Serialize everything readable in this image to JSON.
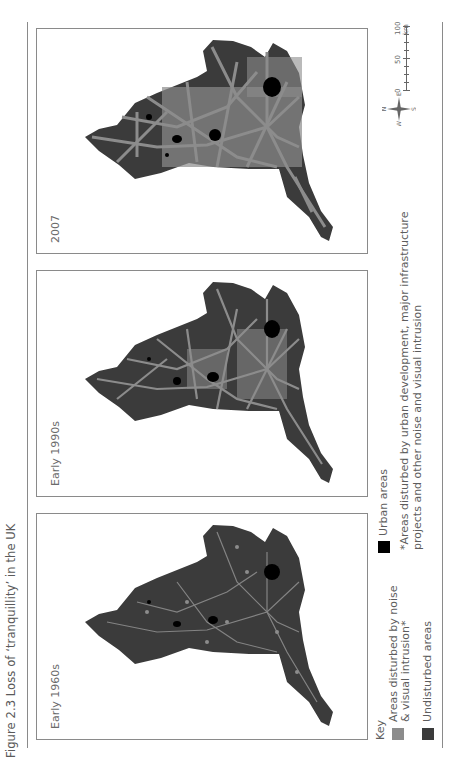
{
  "figure": {
    "title": "Figure 2.3  Loss of ‘tranquillity’ in the UK"
  },
  "panels": [
    {
      "label": "Early 1960s",
      "disturbed_level": "low"
    },
    {
      "label": "Early 1990s",
      "disturbed_level": "medium"
    },
    {
      "label": "2007",
      "disturbed_level": "high"
    }
  ],
  "legend": {
    "title": "Key",
    "items": [
      {
        "label_line1": "Areas disturbed by noise",
        "label_line2": "& visual intrusion*",
        "color": "#8c8c8c"
      },
      {
        "label_line1": "Undisturbed areas",
        "label_line2": "",
        "color": "#3b3b3b"
      },
      {
        "label_line1": "Urban areas",
        "label_line2": "",
        "color": "#000000"
      }
    ],
    "footnote_line1": "*Areas disturbed by urban development, major infrastructure",
    "footnote_line2": "projects and other noise and visual intrusion"
  },
  "compass": {
    "n": "N",
    "s": "S",
    "e": "E",
    "w": "W"
  },
  "scale": {
    "ticks": [
      "0",
      "50",
      "100 km"
    ]
  },
  "colors": {
    "undisturbed": "#3b3b3b",
    "disturbed": "#8c8c8c",
    "urban": "#000000",
    "frame": "#8a8a8a"
  }
}
